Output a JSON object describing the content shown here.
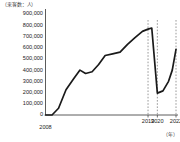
{
  "chart_data": {
    "type": "line",
    "title": "",
    "ylabel": "（来客数：人）",
    "xlabel": "（年）",
    "ylim": [
      0,
      900000
    ],
    "xlim": [
      2008,
      2022
    ],
    "grid": false,
    "legend": "none",
    "yticks": [
      "900,000",
      "800,000",
      "700,000",
      "600,000",
      "500,000",
      "400,000",
      "300,000",
      "200,000",
      "100,000",
      "0"
    ],
    "ytick_values": [
      900000,
      800000,
      700000,
      600000,
      500000,
      400000,
      300000,
      200000,
      100000,
      0
    ],
    "xticks": [
      "2008",
      "2019",
      "2020",
      "2022"
    ],
    "xtick_values": [
      2008,
      2019,
      2020,
      2022
    ],
    "annotations": [
      {
        "name": "dashed-marker-2019",
        "x": 2019
      },
      {
        "name": "dashed-marker-2020",
        "x": 2020
      },
      {
        "name": "dashed-marker-2022",
        "x": 2022
      }
    ],
    "series": [
      {
        "name": "来客数",
        "color": "#1a1a1a",
        "x": [
          2008,
          2008.7,
          2009.4,
          2010.2,
          2011.0,
          2011.7,
          2012.3,
          2013.0,
          2013.7,
          2014.4,
          2015.2,
          2016.0,
          2016.8,
          2017.6,
          2018.4,
          2019.0,
          2019.4,
          2020.0,
          2020.6,
          2021.2,
          2021.6,
          2022.0
        ],
        "values": [
          0,
          0,
          60000,
          225000,
          320000,
          400000,
          370000,
          385000,
          450000,
          530000,
          545000,
          560000,
          630000,
          690000,
          745000,
          765000,
          775000,
          195000,
          215000,
          300000,
          400000,
          585000
        ]
      }
    ]
  },
  "colors": {
    "line": "#1a1a1a",
    "axis": "#4a4a4a",
    "dashed": "#808080",
    "text": "#1d1d1d"
  }
}
